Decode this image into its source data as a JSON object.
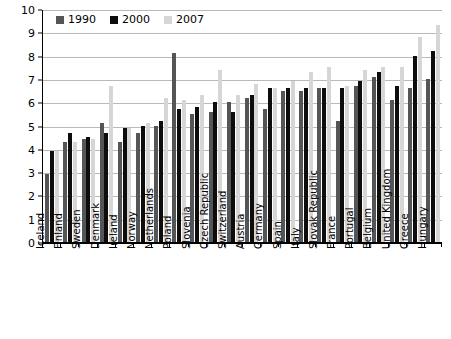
{
  "chart_data": {
    "type": "bar",
    "title": "",
    "subtitle": "",
    "xlabel": "",
    "ylabel": "",
    "ylim": [
      0,
      10
    ],
    "yticks": [
      0,
      1,
      2,
      3,
      4,
      5,
      6,
      7,
      8,
      9,
      10
    ],
    "grid": true,
    "legend_position": "top-left",
    "categories": [
      "Iceland",
      "Finland",
      "Sweden",
      "Denmark",
      "Ireland",
      "Norway",
      "Netherlands",
      "Poland",
      "Slovenia",
      "Czech Republic",
      "Switzerland",
      "Austria",
      "Germany",
      "Spain",
      "Italy",
      "Slovak Republic",
      "France",
      "Portugal",
      "Belgium",
      "United Kingdom",
      "Greece",
      "Hungary"
    ],
    "series": [
      {
        "name": "1990",
        "color": "#555555",
        "values": [
          2.9,
          4.3,
          4.4,
          5.1,
          4.3,
          4.7,
          5.0,
          8.1,
          5.5,
          5.6,
          6.0,
          6.2,
          5.7,
          6.5,
          6.5,
          6.6,
          5.2,
          6.7,
          7.1,
          6.1,
          6.6,
          7.0
        ]
      },
      {
        "name": "2000",
        "color": "#0d0d0d",
        "values": [
          3.9,
          4.7,
          4.5,
          4.7,
          4.9,
          5.0,
          5.2,
          5.7,
          5.8,
          6.0,
          5.6,
          6.3,
          6.6,
          6.6,
          6.6,
          6.6,
          6.6,
          6.9,
          7.3,
          6.7,
          8.0,
          8.2
        ]
      },
      {
        "name": "2007",
        "color": "#d6d6d6",
        "values": [
          3.9,
          4.3,
          4.4,
          6.7,
          4.9,
          5.1,
          6.2,
          6.1,
          6.3,
          7.4,
          6.3,
          6.8,
          6.6,
          6.9,
          7.3,
          7.5,
          6.7,
          7.4,
          7.5,
          7.5,
          8.8,
          9.3
        ]
      }
    ]
  },
  "legend": {
    "entries": [
      {
        "label": "1990",
        "series_key": "s1990"
      },
      {
        "label": "2000",
        "series_key": "s2000"
      },
      {
        "label": "2007",
        "series_key": "s2007"
      }
    ]
  },
  "axis": {
    "y_tick_labels": [
      "0",
      "1",
      "2",
      "3",
      "4",
      "5",
      "6",
      "7",
      "8",
      "9",
      "10"
    ]
  }
}
